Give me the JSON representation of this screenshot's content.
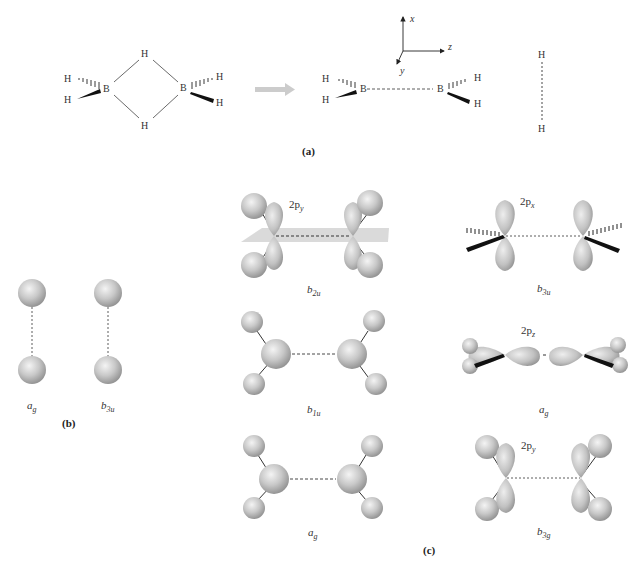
{
  "figure": {
    "panels": {
      "a": "(a)",
      "b": "(b)",
      "c": "(c)"
    },
    "panel_a": {
      "diborane": {
        "atoms": [
          "H",
          "H",
          "B",
          "B",
          "H",
          "H",
          "H",
          "H"
        ],
        "bridge_h_top": "H",
        "bridge_h_bottom": "H",
        "terminal_h_left": [
          "H",
          "H"
        ],
        "terminal_h_right": [
          "H",
          "H"
        ],
        "boron_left": "B",
        "boron_right": "B"
      },
      "arrow_color": "#cccccc",
      "fragments": {
        "bh2_left_h": [
          "H",
          "H"
        ],
        "boron_left": "B",
        "boron_right": "B",
        "bh2_right_h": [
          "H",
          "H"
        ],
        "h2_top": "H",
        "h2_bottom": "H"
      },
      "axes": {
        "x": "x",
        "y": "y",
        "z": "z"
      }
    },
    "panel_b": {
      "orbitals": [
        {
          "symbol": "a",
          "subscript": "g"
        },
        {
          "symbol": "b",
          "subscript": "3u"
        }
      ]
    },
    "panel_c": {
      "orbitals": [
        {
          "symbol": "b",
          "subscript": "2u",
          "ao": "2p",
          "ao_sub": "y"
        },
        {
          "symbol": "b",
          "subscript": "3u",
          "ao": "2p",
          "ao_sub": "x"
        },
        {
          "symbol": "b",
          "subscript": "1u",
          "ao": "",
          "ao_sub": ""
        },
        {
          "symbol": "a",
          "subscript": "g",
          "ao": "2p",
          "ao_sub": "z"
        },
        {
          "symbol": "a",
          "subscript": "g",
          "ao": "",
          "ao_sub": ""
        },
        {
          "symbol": "b",
          "subscript": "3g",
          "ao": "2p",
          "ao_sub": "y"
        }
      ]
    },
    "colors": {
      "sphere_light": "#f2f2f2",
      "sphere_dark": "#9a9a9a",
      "plane": "#d6d6d6",
      "wedge": "#111111"
    }
  }
}
